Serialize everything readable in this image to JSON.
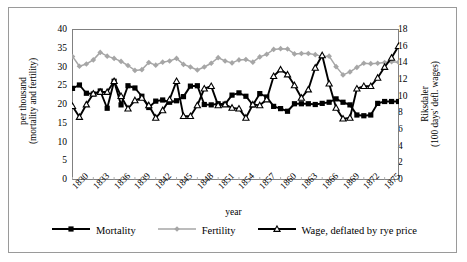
{
  "chart_data": {
    "type": "line",
    "title": "",
    "xlabel": "year",
    "ylabel": "per thousand (mortality and fertility)",
    "y2label": "Riksdaler (100 days' defl. wages)",
    "xlim": [
      1830,
      1877
    ],
    "ylim": [
      0,
      40
    ],
    "y2lim": [
      0,
      18
    ],
    "yticks": [
      0,
      5,
      10,
      15,
      20,
      25,
      30,
      35,
      40
    ],
    "y2ticks": [
      0,
      2,
      4,
      6,
      8,
      10,
      12,
      14,
      16,
      18
    ],
    "xticks": [
      1830,
      1833,
      1836,
      1839,
      1842,
      1845,
      1848,
      1851,
      1854,
      1857,
      1860,
      1863,
      1866,
      1869,
      1872,
      1875
    ],
    "grid": false,
    "legend_position": "bottom",
    "x": [
      1830,
      1831,
      1832,
      1833,
      1834,
      1835,
      1836,
      1837,
      1838,
      1839,
      1840,
      1841,
      1842,
      1843,
      1844,
      1845,
      1846,
      1847,
      1848,
      1849,
      1850,
      1851,
      1852,
      1853,
      1854,
      1855,
      1856,
      1857,
      1858,
      1859,
      1860,
      1861,
      1862,
      1863,
      1864,
      1865,
      1866,
      1867,
      1868,
      1869,
      1870,
      1871,
      1872,
      1873,
      1874,
      1875,
      1876,
      1877
    ],
    "series": [
      {
        "name": "Mortality",
        "axis": "left",
        "units": "per thousand",
        "color": "#000000",
        "marker": "filled-square",
        "values": [
          24.3,
          25.2,
          23.0,
          22.8,
          23.6,
          19.0,
          26.2,
          19.9,
          25.0,
          24.4,
          22.2,
          19.2,
          20.9,
          21.2,
          20.6,
          21.0,
          22.1,
          24.9,
          25.0,
          20.0,
          19.9,
          20.2,
          20.1,
          22.5,
          23.1,
          22.2,
          19.9,
          22.9,
          22.0,
          19.5,
          18.9,
          18.2,
          20.2,
          20.2,
          20.2,
          20.0,
          20.3,
          20.6,
          21.5,
          20.6,
          19.9,
          17.2,
          17.0,
          17.2,
          20.3,
          20.8,
          20.8,
          20.8
        ]
      },
      {
        "name": "Fertility",
        "axis": "left",
        "units": "per thousand",
        "color": "#a6a6a6",
        "marker": "filled-diamond",
        "values": [
          32.8,
          30.2,
          30.8,
          31.9,
          33.9,
          32.9,
          32.3,
          31.5,
          30.4,
          29.1,
          29.3,
          31.2,
          30.5,
          31.3,
          31.6,
          32.3,
          30.7,
          30.0,
          29.2,
          30.0,
          31.0,
          32.5,
          31.6,
          31.1,
          31.9,
          32.0,
          31.3,
          32.7,
          33.4,
          34.7,
          34.9,
          34.8,
          33.5,
          33.6,
          33.6,
          33.3,
          32.8,
          32.9,
          30.1,
          27.9,
          28.7,
          29.9,
          31.0,
          30.9,
          31.0,
          31.2,
          31.4,
          31.3
        ]
      },
      {
        "name": "Wage, deflated by rye price",
        "axis": "right",
        "units": "Riksdaler (100 days' defl. wages)",
        "color": "#000000",
        "marker": "open-triangle",
        "values": [
          8.8,
          7.5,
          9.0,
          10.3,
          10.5,
          10.5,
          11.8,
          10.0,
          8.5,
          9.5,
          9.8,
          8.9,
          7.4,
          8.3,
          9.6,
          11.8,
          7.6,
          7.6,
          8.9,
          10.9,
          11.2,
          8.9,
          9.0,
          8.6,
          8.5,
          7.4,
          9.0,
          8.9,
          9.6,
          12.4,
          13.2,
          12.6,
          11.3,
          9.8,
          10.8,
          13.4,
          14.9,
          11.5,
          8.6,
          7.3,
          7.4,
          10.9,
          11.2,
          11.2,
          12.2,
          13.5,
          14.6,
          16.0
        ]
      }
    ]
  },
  "legend": {
    "items": [
      {
        "label": "Mortality",
        "marker": "filled-square",
        "color": "#000000"
      },
      {
        "label": "Fertility",
        "marker": "filled-diamond",
        "color": "#a6a6a6"
      },
      {
        "label": "Wage, deflated by rye price",
        "marker": "open-triangle",
        "color": "#000000"
      }
    ]
  },
  "axes": {
    "x_title": "year",
    "y_left_line1": "per thousand",
    "y_left_line2": "(mortality and fertility)",
    "y_right_line1": "Riksdaler",
    "y_right_line2": "(100 days' defl. wages)"
  }
}
